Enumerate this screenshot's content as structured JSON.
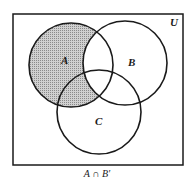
{
  "diagram": {
    "type": "venn",
    "universe_label": "U",
    "sets": [
      {
        "name": "A",
        "label": "A",
        "cx": 71,
        "cy": 65,
        "r": 42,
        "label_x": 64,
        "label_y": 64
      },
      {
        "name": "B",
        "label": "B",
        "cx": 125,
        "cy": 63,
        "r": 42,
        "label_x": 131,
        "label_y": 65
      },
      {
        "name": "C",
        "label": "C",
        "cx": 99,
        "cy": 112,
        "r": 42,
        "label_x": 98,
        "label_y": 125
      }
    ],
    "shaded_region": "A ∩ B′",
    "caption": "A ∩ B′",
    "colors": {
      "stroke": "#1a1a1a",
      "shade": "#b8b8b8",
      "background": "#ffffff"
    }
  }
}
